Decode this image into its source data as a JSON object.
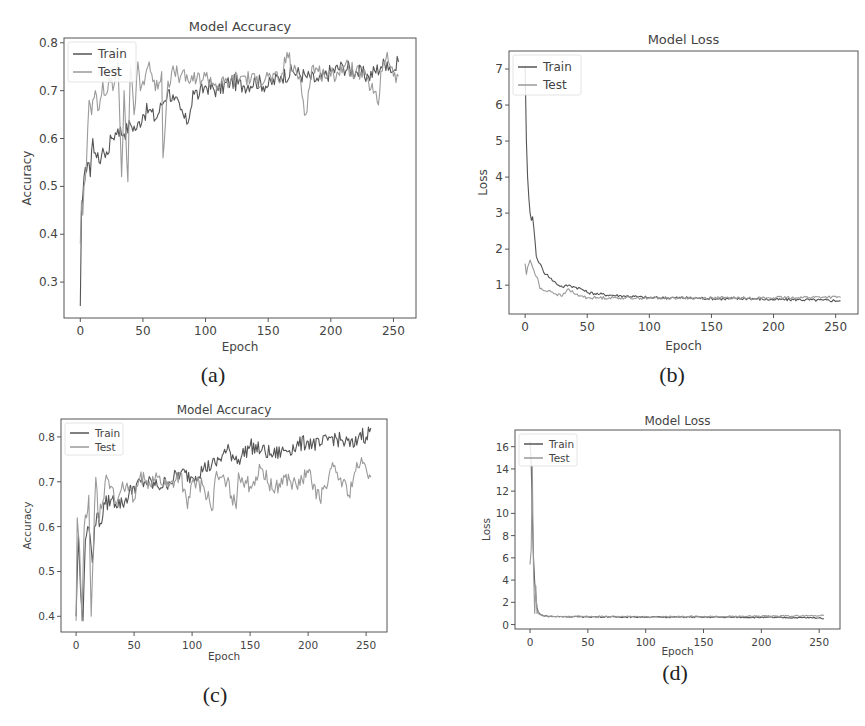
{
  "figure": {
    "panels": [
      {
        "id": "a",
        "caption": "(a)"
      },
      {
        "id": "b",
        "caption": "(b)"
      },
      {
        "id": "c",
        "caption": "(c)"
      },
      {
        "id": "d",
        "caption": "(d)"
      }
    ]
  },
  "colors": {
    "train": "#555555",
    "test": "#9a9a9a",
    "axis": "#555555",
    "text": "#444444"
  },
  "chart_data": [
    {
      "id": "a",
      "type": "line",
      "title": "Model Accuracy",
      "xlabel": "Epoch",
      "ylabel": "Accuracy",
      "xlim": [
        -13,
        268
      ],
      "ylim": [
        0.225,
        0.81
      ],
      "xticks": [
        0,
        50,
        100,
        150,
        200,
        250
      ],
      "yticks": [
        0.3,
        0.4,
        0.5,
        0.6,
        0.7,
        0.8
      ],
      "ytick_labels": [
        "0.3",
        "0.4",
        "0.5",
        "0.6",
        "0.7",
        "0.8"
      ],
      "grid": false,
      "legend": {
        "position": "upper left",
        "entries": [
          "Train",
          "Test"
        ]
      },
      "series": [
        {
          "name": "Train",
          "x": [
            0,
            1,
            2,
            3,
            4,
            5,
            6,
            8,
            10,
            12,
            15,
            18,
            20,
            25,
            30,
            35,
            40,
            45,
            50,
            55,
            60,
            65,
            70,
            75,
            80,
            85,
            88,
            90,
            95,
            100,
            110,
            120,
            130,
            140,
            150,
            160,
            170,
            180,
            190,
            200,
            210,
            220,
            230,
            240,
            245,
            250,
            254
          ],
          "values": [
            0.25,
            0.45,
            0.48,
            0.52,
            0.54,
            0.53,
            0.55,
            0.52,
            0.6,
            0.57,
            0.55,
            0.58,
            0.56,
            0.6,
            0.62,
            0.61,
            0.63,
            0.62,
            0.65,
            0.66,
            0.64,
            0.67,
            0.7,
            0.68,
            0.66,
            0.63,
            0.66,
            0.7,
            0.69,
            0.71,
            0.7,
            0.72,
            0.71,
            0.72,
            0.71,
            0.73,
            0.74,
            0.73,
            0.72,
            0.74,
            0.75,
            0.74,
            0.73,
            0.75,
            0.76,
            0.74,
            0.76
          ]
        },
        {
          "name": "Test",
          "x": [
            0,
            1,
            2,
            3,
            5,
            7,
            9,
            12,
            15,
            18,
            20,
            23,
            26,
            30,
            33,
            35,
            38,
            40,
            43,
            46,
            48,
            50,
            55,
            60,
            65,
            66,
            70,
            75,
            80,
            90,
            100,
            110,
            120,
            130,
            140,
            150,
            160,
            165,
            170,
            175,
            180,
            185,
            190,
            200,
            210,
            220,
            230,
            238,
            240,
            245,
            250,
            254
          ],
          "values": [
            0.38,
            0.47,
            0.44,
            0.5,
            0.55,
            0.68,
            0.65,
            0.7,
            0.66,
            0.72,
            0.69,
            0.73,
            0.7,
            0.76,
            0.52,
            0.7,
            0.51,
            0.75,
            0.65,
            0.76,
            0.7,
            0.72,
            0.76,
            0.7,
            0.74,
            0.56,
            0.72,
            0.74,
            0.73,
            0.72,
            0.73,
            0.71,
            0.72,
            0.73,
            0.72,
            0.73,
            0.72,
            0.78,
            0.74,
            0.73,
            0.65,
            0.75,
            0.74,
            0.73,
            0.75,
            0.74,
            0.72,
            0.67,
            0.74,
            0.78,
            0.73,
            0.73
          ]
        }
      ]
    },
    {
      "id": "b",
      "type": "line",
      "title": "Model Loss",
      "xlabel": "Epoch",
      "ylabel": "Loss",
      "xlim": [
        -13,
        268
      ],
      "ylim": [
        0.2,
        7.5
      ],
      "xticks": [
        0,
        50,
        100,
        150,
        200,
        250
      ],
      "yticks": [
        1,
        2,
        3,
        4,
        5,
        6,
        7
      ],
      "ytick_labels": [
        "1",
        "2",
        "3",
        "4",
        "5",
        "6",
        "7"
      ],
      "grid": false,
      "legend": {
        "position": "upper left",
        "entries": [
          "Train",
          "Test"
        ]
      },
      "series": [
        {
          "name": "Train",
          "x": [
            0,
            1,
            2,
            3,
            4,
            5,
            6,
            7,
            8,
            9,
            10,
            12,
            15,
            18,
            20,
            25,
            30,
            35,
            40,
            45,
            50,
            60,
            70,
            80,
            90,
            100,
            120,
            140,
            160,
            180,
            200,
            220,
            240,
            254
          ],
          "values": [
            7.1,
            5.0,
            4.0,
            3.4,
            3.0,
            2.8,
            2.9,
            2.6,
            2.2,
            1.8,
            1.7,
            1.6,
            1.35,
            1.3,
            1.2,
            1.05,
            0.95,
            1.0,
            0.95,
            0.9,
            0.8,
            0.75,
            0.72,
            0.7,
            0.68,
            0.65,
            0.65,
            0.64,
            0.62,
            0.63,
            0.6,
            0.6,
            0.58,
            0.57
          ]
        },
        {
          "name": "Test",
          "x": [
            0,
            1,
            2,
            4,
            6,
            8,
            10,
            12,
            15,
            20,
            25,
            30,
            35,
            40,
            45,
            50,
            60,
            80,
            100,
            120,
            140,
            160,
            180,
            200,
            220,
            240,
            254
          ],
          "values": [
            1.6,
            1.3,
            1.5,
            1.7,
            1.5,
            1.3,
            1.2,
            0.9,
            0.85,
            0.85,
            0.75,
            0.7,
            0.9,
            0.75,
            0.7,
            0.65,
            0.65,
            0.65,
            0.64,
            0.65,
            0.64,
            0.65,
            0.64,
            0.65,
            0.66,
            0.67,
            0.66
          ]
        }
      ]
    },
    {
      "id": "c",
      "type": "line",
      "title": "Model Accuracy",
      "xlabel": "Epoch",
      "ylabel": "Accuracy",
      "xlim": [
        -13,
        268
      ],
      "ylim": [
        0.365,
        0.84
      ],
      "xticks": [
        0,
        50,
        100,
        150,
        200,
        250
      ],
      "yticks": [
        0.4,
        0.5,
        0.6,
        0.7,
        0.8
      ],
      "ytick_labels": [
        "0.4",
        "0.5",
        "0.6",
        "0.7",
        "0.8"
      ],
      "grid": false,
      "legend": {
        "position": "upper left",
        "entries": [
          "Train",
          "Test"
        ]
      },
      "series": [
        {
          "name": "Train",
          "x": [
            0,
            2,
            4,
            6,
            8,
            10,
            12,
            14,
            16,
            18,
            20,
            25,
            30,
            40,
            50,
            60,
            70,
            80,
            90,
            100,
            110,
            120,
            130,
            140,
            150,
            160,
            170,
            180,
            190,
            200,
            210,
            220,
            230,
            240,
            245,
            250,
            254
          ],
          "values": [
            0.4,
            0.58,
            0.45,
            0.39,
            0.57,
            0.6,
            0.58,
            0.52,
            0.6,
            0.63,
            0.6,
            0.65,
            0.66,
            0.65,
            0.69,
            0.7,
            0.69,
            0.7,
            0.72,
            0.71,
            0.73,
            0.74,
            0.77,
            0.75,
            0.78,
            0.77,
            0.76,
            0.77,
            0.78,
            0.79,
            0.78,
            0.8,
            0.79,
            0.78,
            0.81,
            0.8,
            0.82
          ]
        },
        {
          "name": "Test",
          "x": [
            0,
            1,
            3,
            5,
            7,
            9,
            11,
            13,
            15,
            17,
            19,
            22,
            25,
            30,
            35,
            40,
            45,
            50,
            55,
            60,
            70,
            80,
            90,
            96,
            100,
            110,
            118,
            120,
            130,
            138,
            140,
            150,
            160,
            170,
            180,
            190,
            200,
            210,
            220,
            230,
            235,
            240,
            245,
            250,
            254
          ],
          "values": [
            0.39,
            0.62,
            0.55,
            0.39,
            0.6,
            0.62,
            0.67,
            0.4,
            0.56,
            0.71,
            0.62,
            0.64,
            0.7,
            0.69,
            0.65,
            0.7,
            0.68,
            0.66,
            0.71,
            0.7,
            0.71,
            0.69,
            0.72,
            0.64,
            0.7,
            0.69,
            0.64,
            0.71,
            0.7,
            0.64,
            0.72,
            0.69,
            0.73,
            0.68,
            0.71,
            0.69,
            0.72,
            0.66,
            0.73,
            0.7,
            0.67,
            0.72,
            0.74,
            0.73,
            0.71
          ]
        }
      ]
    },
    {
      "id": "d",
      "type": "line",
      "title": "Model Loss",
      "xlabel": "Epoch",
      "ylabel": "Loss",
      "xlim": [
        -13,
        268
      ],
      "ylim": [
        -0.4,
        17.5
      ],
      "xticks": [
        0,
        50,
        100,
        150,
        200,
        250
      ],
      "yticks": [
        0,
        2,
        4,
        6,
        8,
        10,
        12,
        14,
        16
      ],
      "ytick_labels": [
        "0",
        "2",
        "4",
        "6",
        "8",
        "10",
        "12",
        "14",
        "16"
      ],
      "grid": false,
      "legend": {
        "position": "upper left",
        "entries": [
          "Train",
          "Test"
        ]
      },
      "series": [
        {
          "name": "Train",
          "x": [
            0,
            1,
            2,
            3,
            4,
            5,
            6,
            7,
            8,
            10,
            15,
            20,
            50,
            100,
            150,
            200,
            250,
            254
          ],
          "values": [
            16.5,
            14.5,
            10,
            6,
            3.8,
            2.5,
            1.5,
            1.2,
            1.0,
            0.85,
            0.75,
            0.72,
            0.7,
            0.68,
            0.67,
            0.65,
            0.6,
            0.55
          ]
        },
        {
          "name": "Test",
          "x": [
            0,
            1,
            2,
            3,
            4,
            5,
            6,
            7,
            8,
            10,
            15,
            20,
            50,
            100,
            150,
            200,
            250,
            254
          ],
          "values": [
            5.4,
            6.8,
            14.3,
            5.0,
            1.0,
            3.5,
            1.0,
            1.2,
            0.9,
            0.8,
            0.75,
            0.72,
            0.72,
            0.7,
            0.72,
            0.75,
            0.8,
            0.85
          ]
        }
      ]
    }
  ],
  "layout": {
    "panels": [
      {
        "id": "a",
        "plot": {
          "left": 64,
          "top": 38,
          "right": 416,
          "bottom": 318
        },
        "title_y": 31,
        "xlabel_y": 351,
        "ylabel_x": 31,
        "caption_x": 213,
        "caption_y": 362
      },
      {
        "id": "b",
        "plot": {
          "left": 509,
          "top": 51,
          "right": 858,
          "bottom": 314
        },
        "title_y": 44,
        "xlabel_y": 350,
        "ylabel_x": 487,
        "caption_x": 672,
        "caption_y": 362
      },
      {
        "id": "c",
        "plot": {
          "left": 61,
          "top": 419,
          "right": 387,
          "bottom": 632
        },
        "title_y": 414,
        "xlabel_y": 660,
        "ylabel_x": 31,
        "caption_x": 215,
        "caption_y": 682
      },
      {
        "id": "d",
        "plot": {
          "left": 515,
          "top": 430,
          "right": 840,
          "bottom": 629
        },
        "title_y": 425,
        "xlabel_y": 655,
        "ylabel_x": 490,
        "caption_x": 675,
        "caption_y": 660
      }
    ]
  }
}
